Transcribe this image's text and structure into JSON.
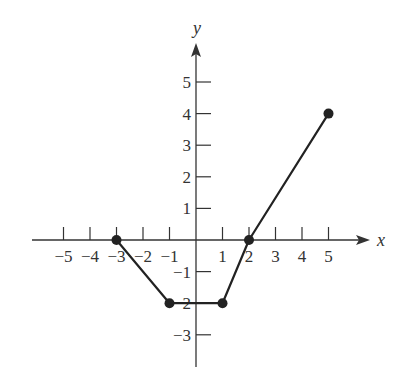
{
  "chart_data": {
    "type": "line",
    "title": "",
    "xlabel": "x",
    "ylabel": "y",
    "xlim": [
      -5.6,
      6.5
    ],
    "ylim": [
      -4.0,
      6.2
    ],
    "grid": false,
    "x_ticks": [
      -5,
      -4,
      -3,
      -2,
      -1,
      1,
      2,
      3,
      4,
      5
    ],
    "x_tick_labels": [
      "−5",
      "−4",
      "−3",
      "−2",
      "−1",
      "1",
      "2",
      "3",
      "4",
      "5"
    ],
    "y_ticks": [
      -3,
      -2,
      -1,
      1,
      2,
      3,
      4,
      5
    ],
    "y_tick_labels": [
      "−3",
      "−2",
      "−1",
      "1",
      "2",
      "3",
      "4",
      "5"
    ],
    "series": [
      {
        "name": "f(x)",
        "points": [
          [
            -3,
            0
          ],
          [
            -1,
            -2
          ],
          [
            1,
            -2
          ],
          [
            2,
            0
          ],
          [
            5,
            4
          ]
        ],
        "x": [
          -3,
          -1,
          1,
          2,
          5
        ],
        "y": [
          0,
          -2,
          -2,
          0,
          4
        ],
        "markers": "filled-circle",
        "color": "#222222"
      }
    ]
  },
  "colors": {
    "axis": "#333333",
    "line": "#222222",
    "background": "#ffffff"
  }
}
